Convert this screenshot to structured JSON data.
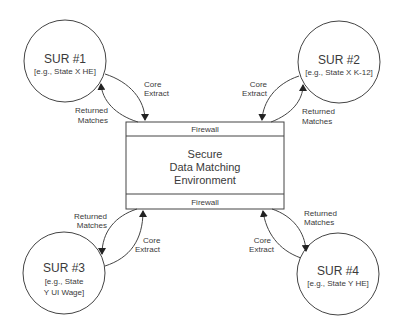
{
  "nodes": {
    "sur1": {
      "title": "SUR #1",
      "line1": "[e.g., State X HE]",
      "line2": ""
    },
    "sur2": {
      "title": "SUR #2",
      "line1": "[e.g., State X K-12]",
      "line2": ""
    },
    "sur3": {
      "title": "SUR #3",
      "line1": "[e.g., State",
      "line2": "Y UI Wage]"
    },
    "sur4": {
      "title": "SUR #4",
      "line1": "[e.g., State Y HE]",
      "line2": ""
    }
  },
  "center": {
    "firewall_top": "Firewall",
    "firewall_bottom": "Firewall",
    "line1": "Secure",
    "line2": "Data Matching",
    "line3": "Environment"
  },
  "edges": {
    "core_extract_1": "Core",
    "core_extract_2": "Extract",
    "returned_1": "Returned",
    "returned_2": "Matches"
  },
  "colors": {
    "stroke": "#333333",
    "text": "#3a3a3a",
    "background": "#ffffff"
  }
}
